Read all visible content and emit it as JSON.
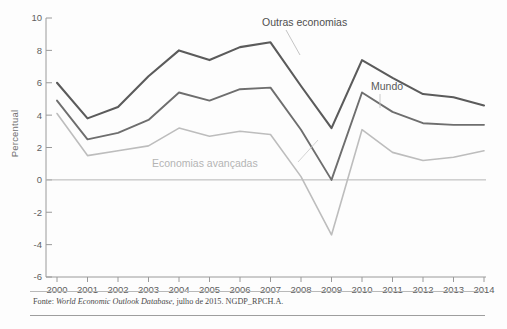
{
  "figure": {
    "y_axis_title": "Percentual",
    "source_prefix": "Fonte:",
    "source_italic": "World Economic Outlook Database",
    "source_rest": ", julho de 2015. NGDP_RPCH.A."
  },
  "annotations": {
    "outras": "Outras economias",
    "mundo": "Mundo",
    "avancadas": "Economias avançadas"
  },
  "colors": {
    "outras": "#5b5b5b",
    "mundo": "#6e6e6e",
    "avancadas": "#bdbdbd",
    "axis": "#9a9a9a",
    "zero_line": "#b5b5b5",
    "text": "#5f5f5f"
  },
  "chart_data": {
    "type": "line",
    "title": "",
    "xlabel": "",
    "ylabel": "Percentual",
    "ylim": [
      -6,
      10
    ],
    "yticks": [
      10,
      8,
      6,
      4,
      2,
      0,
      -2,
      -4,
      -6
    ],
    "ytick_labels": [
      "10",
      "8",
      "6",
      "4",
      "2",
      "0",
      "-2",
      "-4",
      "-6"
    ],
    "grid": false,
    "legend": "inline-annotations",
    "categories": [
      "2000",
      "2001",
      "2002",
      "2003",
      "2004",
      "2005",
      "2006",
      "2007",
      "2008",
      "2009",
      "2010",
      "2011",
      "2012",
      "2013",
      "2014"
    ],
    "series": [
      {
        "name": "Outras economias",
        "color": "#5b5b5b",
        "values": [
          6.0,
          3.8,
          4.5,
          6.4,
          8.0,
          7.4,
          8.2,
          8.5,
          5.8,
          3.2,
          7.4,
          6.3,
          5.3,
          5.1,
          4.6
        ]
      },
      {
        "name": "Mundo",
        "color": "#6e6e6e",
        "values": [
          4.9,
          2.5,
          2.9,
          3.7,
          5.4,
          4.9,
          5.6,
          5.7,
          3.1,
          0.0,
          5.4,
          4.2,
          3.5,
          3.4,
          3.4
        ]
      },
      {
        "name": "Economias avançadas",
        "color": "#bdbdbd",
        "values": [
          4.1,
          1.5,
          1.8,
          2.1,
          3.2,
          2.7,
          3.0,
          2.8,
          0.2,
          -3.4,
          3.1,
          1.7,
          1.2,
          1.4,
          1.8
        ]
      }
    ]
  }
}
